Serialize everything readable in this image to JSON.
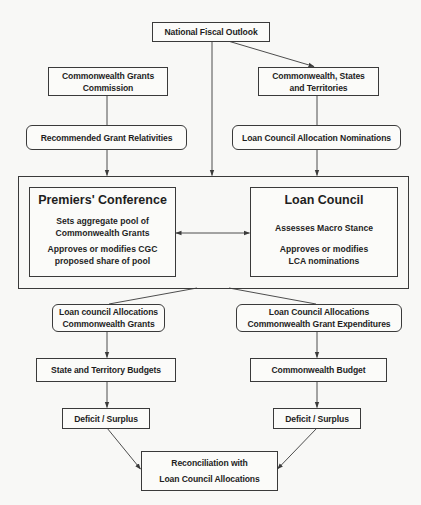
{
  "diagram": {
    "nodes": {
      "national_fiscal_outlook": {
        "lines": [
          "National Fiscal Outlook"
        ]
      },
      "cgc": {
        "lines": [
          "Commonwealth Grants",
          "Commission"
        ]
      },
      "cst": {
        "lines": [
          "Commonwealth, States",
          "and Territories"
        ]
      },
      "recommended_relativities": {
        "lines": [
          "Recommended Grant Relativities"
        ]
      },
      "lca_nominations": {
        "lines": [
          "Loan Council Allocation Nominations"
        ]
      },
      "premiers_conference": {
        "title": "Premiers' Conference",
        "desc1": [
          "Sets aggregate pool of",
          "Commonwealth Grants"
        ],
        "desc2": [
          "Approves or modifies CGC",
          "proposed share of pool"
        ]
      },
      "loan_council": {
        "title": "Loan Council",
        "desc1": [
          "Assesses Macro Stance"
        ],
        "desc2": [
          "Approves or modifies",
          "LCA nominations"
        ]
      },
      "lca_cwth_grants": {
        "lines": [
          "Loan council Allocations",
          "Commonwealth Grants"
        ]
      },
      "lca_cwth_grant_expenditures": {
        "lines": [
          "Loan Council Allocations",
          "Commonwealth Grant Expenditures"
        ]
      },
      "state_territory_budgets": {
        "lines": [
          "State and Territory Budgets"
        ]
      },
      "commonwealth_budget": {
        "lines": [
          "Commonwealth Budget"
        ]
      },
      "deficit_surplus_left": {
        "lines": [
          "Deficit / Surplus"
        ]
      },
      "deficit_surplus_right": {
        "lines": [
          "Deficit / Surplus"
        ]
      },
      "reconciliation": {
        "lines": [
          "Reconciliation with",
          "Loan Council Allocations"
        ]
      }
    },
    "edges": [
      {
        "from": "national_fiscal_outlook",
        "to": "cst",
        "arrow": true
      },
      {
        "from": "national_fiscal_outlook",
        "to": "conference_container",
        "arrow": true
      },
      {
        "from": "cgc",
        "to": "recommended_relativities",
        "arrow": false
      },
      {
        "from": "cst",
        "to": "lca_nominations",
        "arrow": false
      },
      {
        "from": "recommended_relativities",
        "to": "conference_container",
        "arrow": true
      },
      {
        "from": "lca_nominations",
        "to": "conference_container",
        "arrow": true
      },
      {
        "from": "premiers_conference",
        "to": "loan_council",
        "arrow": "both"
      },
      {
        "from": "conference_container",
        "to": "lca_cwth_grants",
        "arrow": false
      },
      {
        "from": "conference_container",
        "to": "lca_cwth_grant_expenditures",
        "arrow": false
      },
      {
        "from": "lca_cwth_grants",
        "to": "state_territory_budgets",
        "arrow": true
      },
      {
        "from": "lca_cwth_grant_expenditures",
        "to": "commonwealth_budget",
        "arrow": true
      },
      {
        "from": "state_territory_budgets",
        "to": "deficit_surplus_left",
        "arrow": true
      },
      {
        "from": "commonwealth_budget",
        "to": "deficit_surplus_right",
        "arrow": true
      },
      {
        "from": "deficit_surplus_left",
        "to": "reconciliation",
        "arrow": true
      },
      {
        "from": "deficit_surplus_right",
        "to": "reconciliation",
        "arrow": true
      }
    ],
    "colors": {
      "line": "#3a3a3a",
      "background": "#f8f8f6",
      "box_fill": "#fbfbf9",
      "text": "#1e1e1e"
    }
  }
}
